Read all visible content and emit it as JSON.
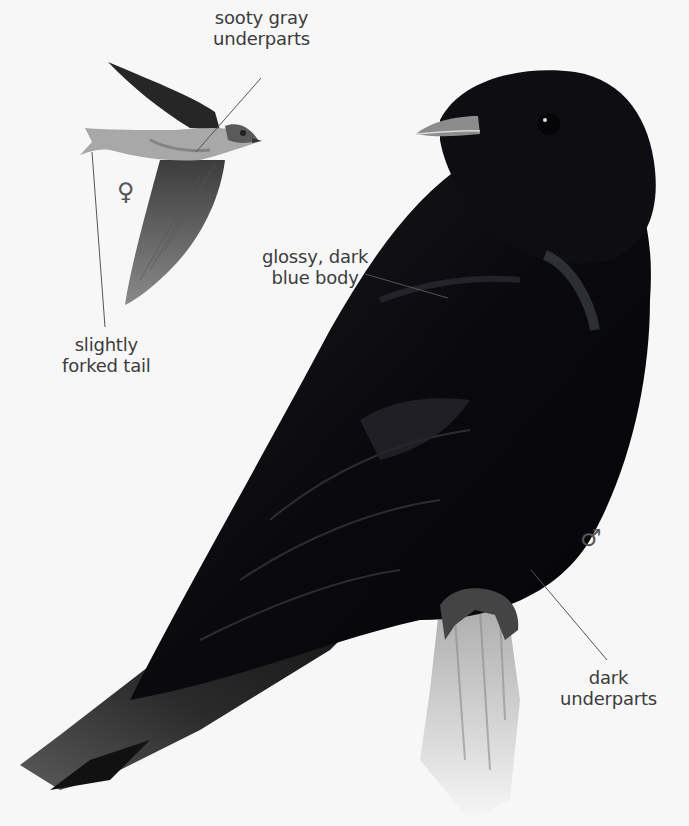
{
  "illustration": {
    "subject": "Purple Martin",
    "background_color": "#f7f7f7",
    "figures": [
      {
        "name": "female-in-flight",
        "sex_symbol": "♀",
        "plumage_color": "#6e6e6e"
      },
      {
        "name": "male-perched",
        "sex_symbol": "♂",
        "plumage_color": "#0b0b10"
      }
    ]
  },
  "labels": {
    "sooty_gray_underparts": {
      "line1": "sooty gray",
      "line2": "underparts"
    },
    "slightly_forked_tail": {
      "line1": "slightly",
      "line2": "forked tail"
    },
    "glossy_dark_blue_body": {
      "line1": "glossy, dark",
      "line2": "blue body"
    },
    "dark_underparts": {
      "line1": "dark",
      "line2": "underparts"
    }
  },
  "symbols": {
    "female": "♀",
    "male": "♂"
  }
}
